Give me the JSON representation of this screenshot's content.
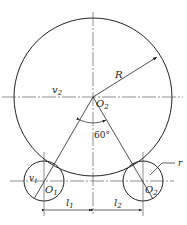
{
  "diagram": {
    "labels": {
      "R": "R",
      "r": "r",
      "v2": "v",
      "v2_sub": "2",
      "v1": "v",
      "v1_sub": "1",
      "O2_center": "O",
      "O2_center_sub": "2",
      "O1": "O",
      "O1_sub": "1",
      "O2_right": "O",
      "O2_right_sub": "2",
      "angle": "60°",
      "l1": "l",
      "l1_sub": "1",
      "l2": "l",
      "l2_sub": "2"
    },
    "colors": {
      "line": "#222222",
      "background": "#ffffff"
    }
  }
}
